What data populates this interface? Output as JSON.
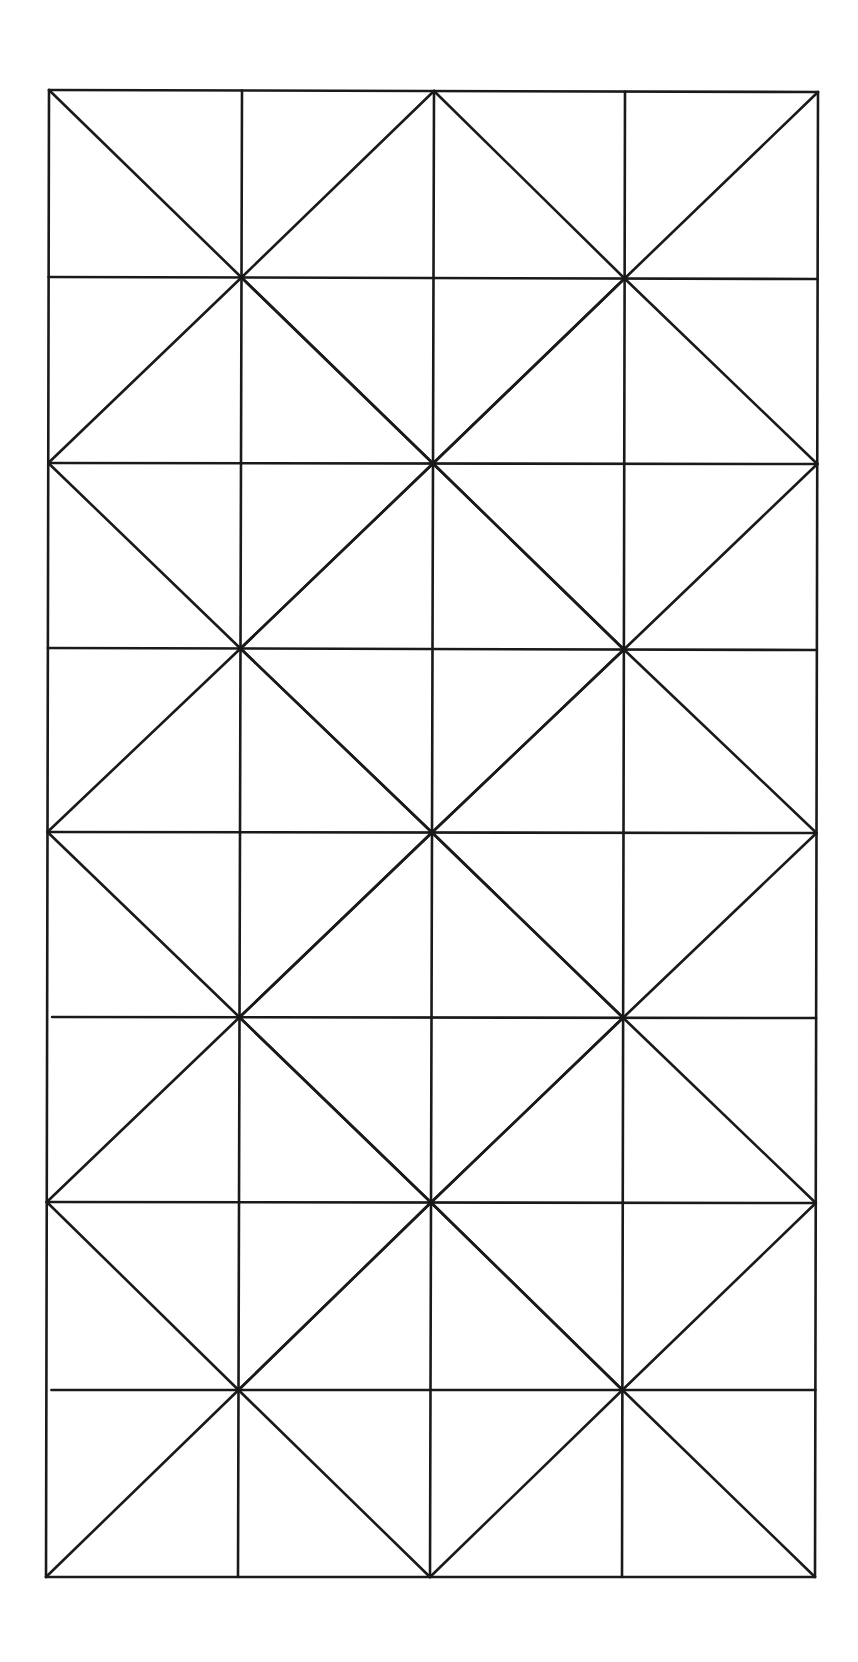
{
  "diagram": {
    "canvas": {
      "width": 858,
      "height": 1662,
      "background": "#ffffff"
    },
    "stroke_color": "#1a1a1a",
    "columns": 4,
    "rows": 8,
    "grid_x_top": [
      49,
      242,
      434,
      625,
      818
    ],
    "grid_x_bottom": [
      46,
      238,
      430,
      622,
      815
    ],
    "grid_y_left": [
      90,
      277,
      463,
      648,
      832,
      1017,
      1202,
      1390,
      1577
    ],
    "grid_y_right": [
      92,
      279,
      464,
      650,
      833,
      1018,
      1203,
      1390,
      1577
    ],
    "horizontal_line_left_start_offsets": {
      "5": 5,
      "7": 5
    },
    "diagonal_centers": [
      [
        1,
        1
      ],
      [
        3,
        1
      ],
      [
        2,
        2
      ],
      [
        1,
        3
      ],
      [
        3,
        3
      ],
      [
        2,
        4
      ],
      [
        1,
        5
      ],
      [
        3,
        5
      ],
      [
        2,
        6
      ],
      [
        1,
        7
      ],
      [
        3,
        7
      ]
    ]
  }
}
